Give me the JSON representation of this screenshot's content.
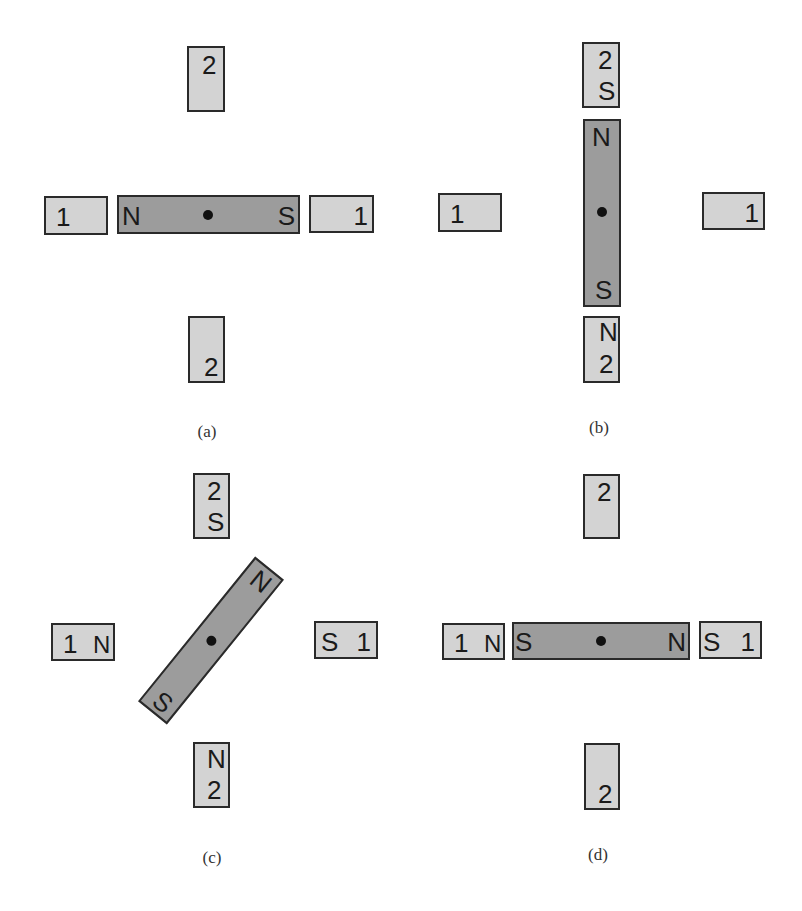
{
  "figure": {
    "colors": {
      "pole_fill": "#d3d3d3",
      "rotor_fill": "#9c9c9c",
      "outline": "#2a2a2a",
      "background": "#ffffff"
    },
    "panels": [
      {
        "id": "a",
        "caption": "(a)",
        "poles": {
          "top": {
            "number": "2",
            "polarity": ""
          },
          "bottom": {
            "number": "2",
            "polarity": ""
          },
          "left": {
            "number": "1",
            "polarity": ""
          },
          "right": {
            "number": "1",
            "polarity": ""
          }
        },
        "rotor": {
          "orientation": "horizontal",
          "end_left": "N",
          "end_right": "S"
        }
      },
      {
        "id": "b",
        "caption": "(b)",
        "poles": {
          "top": {
            "number": "2",
            "polarity": "S"
          },
          "bottom": {
            "number": "2",
            "polarity": "N"
          },
          "left": {
            "number": "1",
            "polarity": ""
          },
          "right": {
            "number": "1",
            "polarity": ""
          }
        },
        "rotor": {
          "orientation": "vertical",
          "end_top": "N",
          "end_bottom": "S"
        }
      },
      {
        "id": "c",
        "caption": "(c)",
        "poles": {
          "top": {
            "number": "2",
            "polarity": "S"
          },
          "bottom": {
            "number": "2",
            "polarity": "N"
          },
          "left": {
            "number": "1",
            "polarity": "N"
          },
          "right": {
            "number": "1",
            "polarity": "S"
          }
        },
        "rotor": {
          "orientation": "diagonal",
          "angle_deg": -50,
          "end_upper_right": "N",
          "end_lower_left": "S"
        }
      },
      {
        "id": "d",
        "caption": "(d)",
        "poles": {
          "top": {
            "number": "2",
            "polarity": ""
          },
          "bottom": {
            "number": "2",
            "polarity": ""
          },
          "left": {
            "number": "1",
            "polarity": "N"
          },
          "right": {
            "number": "1",
            "polarity": "S"
          }
        },
        "rotor": {
          "orientation": "horizontal",
          "end_left": "S",
          "end_right": "N"
        }
      }
    ]
  }
}
